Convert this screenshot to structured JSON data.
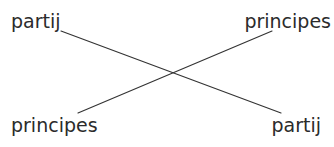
{
  "figure": {
    "background_color": "#ffffff",
    "text_color": "#2b2b2b",
    "line_color": "#333333",
    "width": 334,
    "height": 147,
    "labels": {
      "top_left": "partij",
      "top_right": "principes",
      "bottom_left": "principes",
      "bottom_right": "partij"
    },
    "connectors": [
      {
        "name": "partij-to-partij",
        "from": "top_left",
        "to": "bottom_right",
        "x1": 61,
        "y1": 31,
        "x2": 281,
        "y2": 113
      },
      {
        "name": "principes-to-principes",
        "from": "bottom_left",
        "to": "top_right",
        "x1": 78,
        "y1": 113,
        "x2": 272,
        "y2": 31
      }
    ],
    "crossing_point": {
      "x": 171,
      "y": 72
    }
  }
}
